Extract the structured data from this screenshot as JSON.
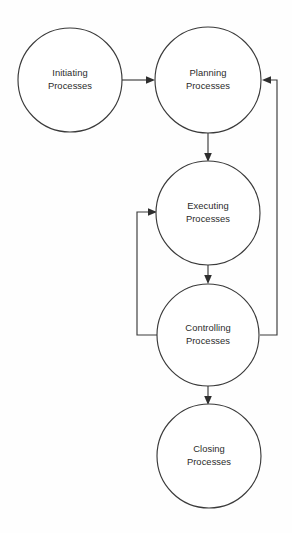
{
  "diagram": {
    "background_color": "#fefefe",
    "stroke_color": "#3a3a3a",
    "text_color": "#2b2b2b",
    "nodes": [
      {
        "id": "initiating",
        "line1": "Initiating",
        "line2": "Processes",
        "cx": 70,
        "cy": 80,
        "r": 52
      },
      {
        "id": "planning",
        "line1": "Planning",
        "line2": "Processes",
        "cx": 208,
        "cy": 80,
        "r": 53
      },
      {
        "id": "executing",
        "line1": "Executing",
        "line2": "Processes",
        "cx": 208,
        "cy": 213,
        "r": 52
      },
      {
        "id": "controlling",
        "line1": "Controlling",
        "line2": "Processes",
        "cx": 208,
        "cy": 335,
        "r": 51
      },
      {
        "id": "closing",
        "line1": "Closing",
        "line2": "Processes",
        "cx": 209,
        "cy": 456,
        "r": 52
      }
    ],
    "connectors": [
      {
        "id": "initiating-to-planning",
        "from": "initiating",
        "to": "planning",
        "label": "Initiating Processes to Planning Processes",
        "direction": "right"
      },
      {
        "id": "planning-to-executing",
        "from": "planning",
        "to": "executing",
        "label": "Planning Processes to Executing Processes",
        "direction": "down"
      },
      {
        "id": "executing-to-controlling",
        "from": "executing",
        "to": "controlling",
        "label": "Executing Processes to Controlling Processes",
        "direction": "down"
      },
      {
        "id": "controlling-to-closing",
        "from": "controlling",
        "to": "closing",
        "label": "Controlling Processes to Closing Processes",
        "direction": "down"
      },
      {
        "id": "controlling-to-planning-feedback",
        "from": "controlling",
        "to": "planning",
        "label": "Controlling Processes feedback to Planning Processes",
        "direction": "left"
      },
      {
        "id": "controlling-to-executing-feedback",
        "from": "controlling",
        "to": "executing",
        "label": "Controlling Processes feedback to Executing Processes",
        "direction": "right"
      }
    ]
  }
}
